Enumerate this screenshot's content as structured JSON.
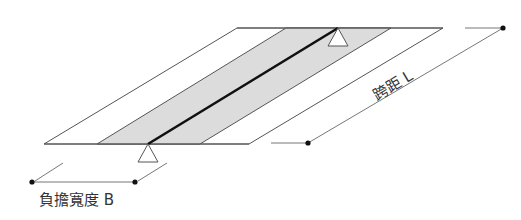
{
  "diagram": {
    "type": "bridge-slab-plan-isometric",
    "labels": {
      "span": "跨距 L",
      "width": "負擔寬度 B"
    },
    "colors": {
      "outline": "#555555",
      "band_fill": "#dcdcdc",
      "beam": "#111111",
      "dimension": "#777777",
      "dot": "#111111",
      "text": "#333333"
    },
    "elements": {
      "slab": "parallelogram deck",
      "tributary_band": "shaded load-bearing width",
      "beam": "center girder line",
      "supports": [
        "bottom support",
        "top support"
      ],
      "span_dimension": "span L dimension line",
      "width_dimension": "tributary width B dimension line"
    }
  }
}
